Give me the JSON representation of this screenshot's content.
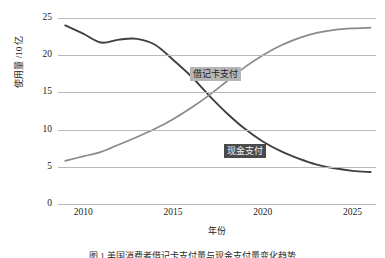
{
  "chart_data": {
    "type": "line",
    "title": "",
    "xlabel": "年份",
    "ylabel": "使用量 /10 亿",
    "xlim": [
      2008.6,
      2026.3
    ],
    "ylim": [
      0,
      25
    ],
    "grid": true,
    "grid_axis": "y",
    "legend_position": "inline-labels",
    "yticks": [
      25,
      20,
      15,
      10,
      5,
      0
    ],
    "xticks": [
      2010,
      2015,
      2020,
      2025
    ],
    "series": [
      {
        "name": "现金支付",
        "color": "#404040",
        "label_background": "#4a4a4a",
        "label_color": "#f2f2f2",
        "x": [
          2009,
          2010,
          2011,
          2012,
          2013,
          2014,
          2015,
          2016,
          2017,
          2018,
          2019,
          2020,
          2021,
          2022,
          2023,
          2024,
          2025,
          2026
        ],
        "values": [
          24.0,
          22.9,
          21.7,
          22.1,
          22.2,
          21.4,
          19.4,
          17.2,
          14.6,
          12.2,
          10.1,
          8.4,
          7.1,
          6.1,
          5.3,
          4.8,
          4.45,
          4.3
        ]
      },
      {
        "name": "借记卡支付",
        "color": "#8a8a8a",
        "label_background": "#b5b5b5",
        "label_color": "#1e1e1e",
        "x": [
          2009,
          2010,
          2011,
          2012,
          2013,
          2014,
          2015,
          2016,
          2017,
          2018,
          2019,
          2020,
          2021,
          2022,
          2023,
          2024,
          2025,
          2026
        ],
        "values": [
          5.8,
          6.4,
          7.0,
          8.0,
          9.0,
          10.1,
          11.4,
          12.9,
          14.6,
          16.5,
          18.4,
          20.0,
          21.3,
          22.3,
          23.0,
          23.4,
          23.6,
          23.7
        ]
      }
    ]
  },
  "caption": {
    "text": "图 1  美国消费者借记卡支付量与现金支付量变化趋势"
  }
}
